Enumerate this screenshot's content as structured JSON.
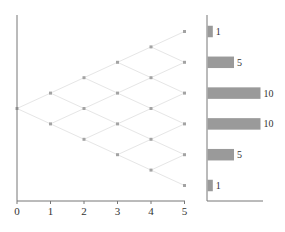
{
  "chart_data": [
    {
      "type": "scatter",
      "title": "",
      "description": "Binomial lattice (recombining tree) of 5 steps; points connected by faint lines",
      "xlabel": "",
      "ylabel": "",
      "x_ticks": [
        "0",
        "1",
        "2",
        "3",
        "4",
        "5"
      ],
      "xlim": [
        0,
        5
      ],
      "grid": false,
      "points": [
        {
          "x": 0,
          "level": 0
        },
        {
          "x": 1,
          "level": 1
        },
        {
          "x": 1,
          "level": -1
        },
        {
          "x": 2,
          "level": 2
        },
        {
          "x": 2,
          "level": 0
        },
        {
          "x": 2,
          "level": -2
        },
        {
          "x": 3,
          "level": 3
        },
        {
          "x": 3,
          "level": 1
        },
        {
          "x": 3,
          "level": -1
        },
        {
          "x": 3,
          "level": -3
        },
        {
          "x": 4,
          "level": 4
        },
        {
          "x": 4,
          "level": 2
        },
        {
          "x": 4,
          "level": 0
        },
        {
          "x": 4,
          "level": -2
        },
        {
          "x": 4,
          "level": -4
        },
        {
          "x": 5,
          "level": 5
        },
        {
          "x": 5,
          "level": 3
        },
        {
          "x": 5,
          "level": 1
        },
        {
          "x": 5,
          "level": -1
        },
        {
          "x": 5,
          "level": -3
        },
        {
          "x": 5,
          "level": -5
        }
      ]
    },
    {
      "type": "bar",
      "orientation": "horizontal",
      "description": "Number of paths reaching each terminal node (binomial coefficients)",
      "categories": [
        "level 5",
        "level 3",
        "level 1",
        "level -1",
        "level -3",
        "level -5"
      ],
      "values": [
        1,
        5,
        10,
        10,
        5,
        1
      ],
      "data_labels": [
        "1",
        "5",
        "10",
        "10",
        "5",
        "1"
      ],
      "xlim": [
        0,
        10
      ]
    }
  ],
  "colors": {
    "axis": "#777777",
    "lattice_line": "#e6e6e6",
    "point": "#a3a3a3",
    "bar": "#9a9a9a"
  }
}
